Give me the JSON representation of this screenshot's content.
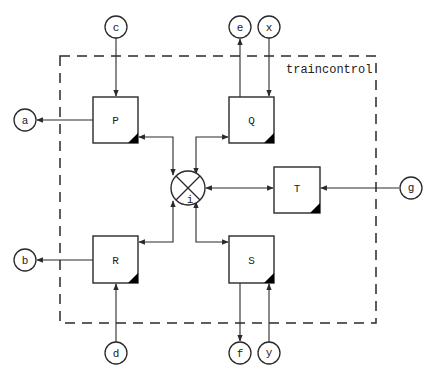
{
  "diagram": {
    "system_label": "traincontrol",
    "colors": {
      "stroke": "#2a2a2a",
      "fill": "#ffffff",
      "corner": "#000000"
    },
    "boundary": {
      "style": "dashed",
      "x": 60,
      "y": 56,
      "width": 316,
      "height": 267
    },
    "processes": [
      {
        "id": "P",
        "label": "P",
        "x": 93,
        "y": 97,
        "w": 45,
        "h": 46
      },
      {
        "id": "Q",
        "label": "Q",
        "x": 229,
        "y": 97,
        "w": 45,
        "h": 46
      },
      {
        "id": "T",
        "label": "T",
        "x": 274,
        "y": 167,
        "w": 46,
        "h": 46
      },
      {
        "id": "R",
        "label": "R",
        "x": 93,
        "y": 236,
        "w": 45,
        "h": 47
      },
      {
        "id": "S",
        "label": "S",
        "x": 229,
        "y": 236,
        "w": 45,
        "h": 47
      }
    ],
    "interface": {
      "id": "i",
      "label": "i",
      "cx": 188,
      "cy": 188,
      "r": 17
    },
    "terminals": [
      {
        "id": "c",
        "label": "c",
        "cx": 116,
        "cy": 27
      },
      {
        "id": "e",
        "label": "e",
        "cx": 240,
        "cy": 27
      },
      {
        "id": "x",
        "label": "x",
        "cx": 269,
        "cy": 27
      },
      {
        "id": "a",
        "label": "a",
        "cx": 25,
        "cy": 120
      },
      {
        "id": "b",
        "label": "b",
        "cx": 25,
        "cy": 260
      },
      {
        "id": "g",
        "label": "g",
        "cx": 411,
        "cy": 188
      },
      {
        "id": "d",
        "label": "d",
        "cx": 116,
        "cy": 353
      },
      {
        "id": "f",
        "label": "f",
        "cx": 240,
        "cy": 353
      },
      {
        "id": "y",
        "label": "y",
        "cx": 269,
        "cy": 353
      }
    ],
    "connections": [
      {
        "from": "c",
        "to": "P",
        "direction": "in"
      },
      {
        "from": "P",
        "to": "a",
        "direction": "out"
      },
      {
        "from": "Q",
        "to": "e",
        "direction": "out"
      },
      {
        "from": "x",
        "to": "Q",
        "direction": "in"
      },
      {
        "from": "g",
        "to": "T",
        "direction": "in"
      },
      {
        "from": "R",
        "to": "b",
        "direction": "out"
      },
      {
        "from": "d",
        "to": "R",
        "direction": "in"
      },
      {
        "from": "S",
        "to": "f",
        "direction": "out"
      },
      {
        "from": "y",
        "to": "S",
        "direction": "in"
      },
      {
        "from": "P",
        "to": "i",
        "direction": "both"
      },
      {
        "from": "Q",
        "to": "i",
        "direction": "both"
      },
      {
        "from": "T",
        "to": "i",
        "direction": "both"
      },
      {
        "from": "R",
        "to": "i",
        "direction": "both"
      },
      {
        "from": "S",
        "to": "i",
        "direction": "both"
      }
    ]
  }
}
